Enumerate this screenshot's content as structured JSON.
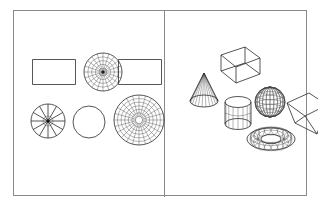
{
  "figure": {
    "background_color": "#ffffff",
    "frame_color": "#8a8a8a",
    "line_color": "#2b2b2b",
    "panels": [
      {
        "id": "left",
        "name": "two-dimensional-primitives",
        "shapes": [
          {
            "id": "rect-plain-top-left",
            "name": "rectangle-outline",
            "kind": "rectangle",
            "mesh": "none",
            "x": 18,
            "y": 48,
            "w": 44,
            "h": 26
          },
          {
            "id": "disk-dense-top-middle",
            "name": "radial-mesh-disk-dense",
            "kind": "disk",
            "mesh": "polar",
            "rings": 4,
            "spokes": 20,
            "x": 68,
            "y": 40,
            "w": 42,
            "h": 42
          },
          {
            "id": "rect-plain-top-right",
            "name": "rectangle-outline",
            "kind": "rectangle",
            "mesh": "none",
            "x": 104,
            "y": 48,
            "w": 44,
            "h": 26
          },
          {
            "id": "disk-spokes-bottom-left",
            "name": "radial-spoke-disk",
            "kind": "disk",
            "mesh": "spokes",
            "rings": 1,
            "spokes": 12,
            "x": 12,
            "y": 88,
            "w": 44,
            "h": 44
          },
          {
            "id": "circle-plain-bottom-middle",
            "name": "circle-outline",
            "kind": "circle",
            "mesh": "none",
            "x": 56,
            "y": 92,
            "w": 38,
            "h": 38
          },
          {
            "id": "disk-polar-bottom-right",
            "name": "radial-mesh-disk-large",
            "kind": "disk",
            "mesh": "polar",
            "rings": 6,
            "spokes": 24,
            "x": 98,
            "y": 82,
            "w": 54,
            "h": 54
          }
        ]
      },
      {
        "id": "right",
        "name": "three-dimensional-primitives",
        "shapes": [
          {
            "id": "cone",
            "name": "wireframe-cone",
            "kind": "cone",
            "mesh": "radial",
            "segments": 12,
            "x": 22,
            "y": 58,
            "w": 34,
            "h": 42
          },
          {
            "id": "box",
            "name": "wireframe-box",
            "kind": "cuboid",
            "mesh": "edges",
            "x": 40,
            "y": 34,
            "w": 56,
            "h": 48
          },
          {
            "id": "cylinder",
            "name": "wireframe-cylinder",
            "kind": "cylinder",
            "mesh": "quad",
            "segments": 8,
            "x": 56,
            "y": 82,
            "w": 34,
            "h": 42
          },
          {
            "id": "sphere",
            "name": "wireframe-sphere",
            "kind": "sphere",
            "mesh": "latitude-longitude",
            "parallels": 7,
            "meridians": 12,
            "x": 88,
            "y": 74,
            "w": 34,
            "h": 34
          },
          {
            "id": "torus",
            "name": "wireframe-torus",
            "kind": "torus",
            "mesh": "tube",
            "rings": 16,
            "sides": 10,
            "x": 80,
            "y": 106,
            "w": 52,
            "h": 44
          },
          {
            "id": "wedge",
            "name": "wireframe-wedge-prism",
            "kind": "wedge",
            "mesh": "edges",
            "x": 118,
            "y": 78,
            "w": 48,
            "h": 50
          }
        ]
      }
    ]
  }
}
